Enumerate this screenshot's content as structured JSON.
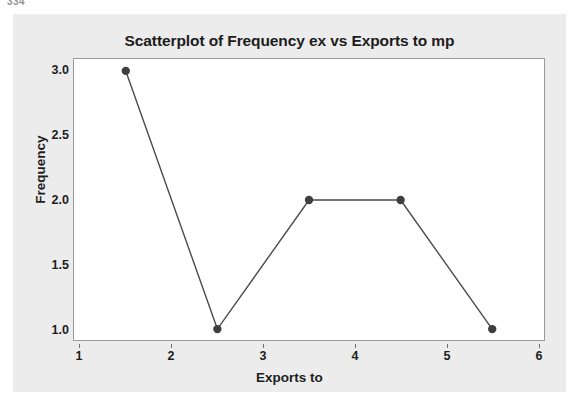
{
  "page": {
    "corner_remnant": "334"
  },
  "card": {
    "background": "#ececec"
  },
  "chart_data": {
    "type": "line",
    "title": "Scatterplot of Frequency ex vs Exports to mp",
    "xlabel": "Exports to",
    "ylabel": "Frequency",
    "x": [
      1.5,
      2.5,
      3.5,
      4.5,
      5.5
    ],
    "values": [
      3.0,
      1.0,
      2.0,
      2.0,
      1.0
    ],
    "series": [
      {
        "name": "Frequency",
        "x": [
          1.5,
          2.5,
          3.5,
          4.5,
          5.5
        ],
        "values": [
          3.0,
          1.0,
          2.0,
          2.0,
          1.0
        ]
      }
    ],
    "xlim": [
      1,
      6
    ],
    "ylim": [
      1.0,
      3.0
    ],
    "xticks": [
      1,
      2,
      3,
      4,
      5,
      6
    ],
    "xtick_labels": [
      "1",
      "2",
      "3",
      "4",
      "5",
      "6"
    ],
    "yticks": [
      1.0,
      1.5,
      2.0,
      2.5,
      3.0
    ],
    "ytick_labels": [
      "1.0",
      "1.5",
      "2.0",
      "2.5",
      "3.0"
    ],
    "grid": false,
    "legend": null,
    "marker": "circle",
    "marker_color": "#3f3f3f",
    "line_color": "#4a4a4a",
    "panel_background": "#ffffff",
    "panel_border": "#9a9a9a"
  },
  "watermark": {
    "text": ""
  }
}
